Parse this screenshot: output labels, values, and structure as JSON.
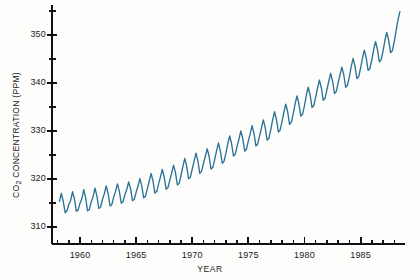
{
  "chart_data": {
    "type": "line",
    "title": "",
    "xlabel": "YEAR",
    "ylabel_prefix": "CO",
    "ylabel_sub": "2",
    "ylabel_suffix": " CONCENTRATION (PPM)",
    "ylabel": "CO2 CONCENTRATION (PPM)",
    "xlim": [
      1957.5,
      1988.6
    ],
    "ylim": [
      306.5,
      356.0
    ],
    "x_major_ticks": [
      1960,
      1965,
      1970,
      1975,
      1980,
      1985
    ],
    "x_major_labels": [
      "1960",
      "1965",
      "1970",
      "1975",
      "1980",
      "1985"
    ],
    "x_minor_step": 1,
    "y_major_ticks": [
      310,
      320,
      330,
      340,
      350
    ],
    "y_major_labels": [
      "310",
      "320",
      "330",
      "340",
      "350"
    ],
    "y_minor_ticks": [
      315,
      325,
      335,
      345,
      355
    ],
    "grid": false,
    "legend": false,
    "line_color": "#2b7296",
    "axis_color": "#111111",
    "background": "#fdfdfc",
    "series": [
      {
        "name": "Mauna Loa monthly mean CO2",
        "units": "PPM",
        "x": [
          1958.17,
          1958.33,
          1958.5,
          1958.67,
          1958.83,
          1959.0,
          1959.17,
          1959.33,
          1959.5,
          1959.67,
          1959.83,
          1960.0,
          1960.17,
          1960.33,
          1960.5,
          1960.67,
          1960.83,
          1961.0,
          1961.17,
          1961.33,
          1961.5,
          1961.67,
          1961.83,
          1962.0,
          1962.17,
          1962.33,
          1962.5,
          1962.67,
          1962.83,
          1963.0,
          1963.17,
          1963.33,
          1963.5,
          1963.67,
          1963.83,
          1964.0,
          1964.17,
          1964.33,
          1964.5,
          1964.67,
          1964.83,
          1965.0,
          1965.17,
          1965.33,
          1965.5,
          1965.67,
          1965.83,
          1966.0,
          1966.17,
          1966.33,
          1966.5,
          1966.67,
          1966.83,
          1967.0,
          1967.17,
          1967.33,
          1967.5,
          1967.67,
          1967.83,
          1968.0,
          1968.17,
          1968.33,
          1968.5,
          1968.67,
          1968.83,
          1969.0,
          1969.17,
          1969.33,
          1969.5,
          1969.67,
          1969.83,
          1970.0,
          1970.17,
          1970.33,
          1970.5,
          1970.67,
          1970.83,
          1971.0,
          1971.17,
          1971.33,
          1971.5,
          1971.67,
          1971.83,
          1972.0,
          1972.17,
          1972.33,
          1972.5,
          1972.67,
          1972.83,
          1973.0,
          1973.17,
          1973.33,
          1973.5,
          1973.67,
          1973.83,
          1974.0,
          1974.17,
          1974.33,
          1974.5,
          1974.67,
          1974.83,
          1975.0,
          1975.17,
          1975.33,
          1975.5,
          1975.67,
          1975.83,
          1976.0,
          1976.17,
          1976.33,
          1976.5,
          1976.67,
          1976.83,
          1977.0,
          1977.17,
          1977.33,
          1977.5,
          1977.67,
          1977.83,
          1978.0,
          1978.17,
          1978.33,
          1978.5,
          1978.67,
          1978.83,
          1979.0,
          1979.17,
          1979.33,
          1979.5,
          1979.67,
          1979.83,
          1980.0,
          1980.17,
          1980.33,
          1980.5,
          1980.67,
          1980.83,
          1981.0,
          1981.17,
          1981.33,
          1981.5,
          1981.67,
          1981.83,
          1982.0,
          1982.17,
          1982.33,
          1982.5,
          1982.67,
          1982.83,
          1983.0,
          1983.17,
          1983.33,
          1983.5,
          1983.67,
          1983.83,
          1984.0,
          1984.17,
          1984.33,
          1984.5,
          1984.67,
          1984.83,
          1985.0,
          1985.17,
          1985.33,
          1985.5,
          1985.67,
          1985.83,
          1986.0,
          1986.17,
          1986.33,
          1986.5,
          1986.67,
          1986.83,
          1987.0,
          1987.17,
          1987.33,
          1987.5,
          1987.67,
          1987.83,
          1988.0,
          1988.17,
          1988.33,
          1988.5
        ],
        "y": [
          315.4,
          317.0,
          315.4,
          313.0,
          313.4,
          314.7,
          315.6,
          317.4,
          315.9,
          313.3,
          313.6,
          315.0,
          316.0,
          317.8,
          316.1,
          313.4,
          313.7,
          315.3,
          316.4,
          318.1,
          316.5,
          313.9,
          314.2,
          315.8,
          317.0,
          318.6,
          317.0,
          314.4,
          314.7,
          316.3,
          317.5,
          319.0,
          317.5,
          315.0,
          315.3,
          316.8,
          317.9,
          319.4,
          318.0,
          315.5,
          315.8,
          317.3,
          318.6,
          320.1,
          318.6,
          316.1,
          316.4,
          318.0,
          319.6,
          321.2,
          319.6,
          317.1,
          317.4,
          319.0,
          320.5,
          322.0,
          320.4,
          317.9,
          318.2,
          319.8,
          321.3,
          322.9,
          321.4,
          318.8,
          319.1,
          320.8,
          322.7,
          324.3,
          322.7,
          320.1,
          320.4,
          322.1,
          323.8,
          325.4,
          323.8,
          321.2,
          321.6,
          323.3,
          324.8,
          326.3,
          324.7,
          322.1,
          322.4,
          324.1,
          325.9,
          327.5,
          325.9,
          323.3,
          323.7,
          325.4,
          327.4,
          329.0,
          327.4,
          324.8,
          325.2,
          326.9,
          328.4,
          330.0,
          328.4,
          325.8,
          326.2,
          328.0,
          329.5,
          331.1,
          329.5,
          326.9,
          327.3,
          329.0,
          330.7,
          332.3,
          330.7,
          328.1,
          328.5,
          330.3,
          332.4,
          334.0,
          332.4,
          329.8,
          330.2,
          332.0,
          334.0,
          335.6,
          334.0,
          331.4,
          331.8,
          333.6,
          335.7,
          337.3,
          335.7,
          333.1,
          333.5,
          335.3,
          337.5,
          339.1,
          337.5,
          334.9,
          335.3,
          337.1,
          339.0,
          340.6,
          339.0,
          336.4,
          336.8,
          338.6,
          340.4,
          342.0,
          340.4,
          337.8,
          338.2,
          340.0,
          341.7,
          343.3,
          341.7,
          339.1,
          339.5,
          341.3,
          343.5,
          345.1,
          343.5,
          340.9,
          341.3,
          343.1,
          345.2,
          346.8,
          345.2,
          342.6,
          343.0,
          344.8,
          347.0,
          348.6,
          347.0,
          344.4,
          344.8,
          346.6,
          348.9,
          350.5,
          348.9,
          346.3,
          346.7,
          348.6,
          351.0,
          353.1,
          354.8
        ]
      }
    ]
  }
}
